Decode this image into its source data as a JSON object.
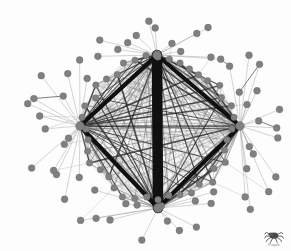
{
  "figure": {
    "name": "network-graph",
    "type": "force-directed network diagram",
    "background_color": "#fdfdfd",
    "node_color": "#808080",
    "node_stroke_color": "#6a6a6a",
    "thin_edge_color": "#9a9a9a",
    "thick_edge_color": "#101010"
  },
  "watermark": {
    "label": "Pajek",
    "icon": "spider-icon",
    "color": "#7a7a7a"
  },
  "chart_data": {
    "type": "network",
    "title": "",
    "node_count": 104,
    "hub_count": 4,
    "inner_ring_count": 40,
    "outer_pendant_count": 60,
    "node_radius_hub": 4.2,
    "node_radius_inner": 3.2,
    "node_radius_outer": 3.4,
    "hubs": [
      {
        "id": "H-top",
        "x": 157,
        "y": 55,
        "r": 4.4,
        "degree": 46
      },
      {
        "id": "H-left",
        "x": 80,
        "y": 126,
        "r": 4.4,
        "degree": 38
      },
      {
        "id": "H-right",
        "x": 240,
        "y": 126,
        "r": 4.4,
        "degree": 33
      },
      {
        "id": "H-bottom",
        "x": 158,
        "y": 208,
        "r": 4.6,
        "degree": 52
      }
    ],
    "hub_edges": [
      {
        "source": "H-top",
        "target": "H-bottom",
        "weight": 10.5
      },
      {
        "source": "H-top",
        "target": "H-left",
        "weight": 4.2
      },
      {
        "source": "H-top",
        "target": "H-right",
        "weight": 4.0
      },
      {
        "source": "H-left",
        "target": "H-bottom",
        "weight": 4.2
      },
      {
        "source": "H-right",
        "target": "H-bottom",
        "weight": 4.0
      },
      {
        "source": "H-left",
        "target": "H-right",
        "weight": 0.8
      }
    ],
    "inner_ring": {
      "center_x": 158,
      "center_y": 129,
      "radius_x": 74,
      "radius_y": 72,
      "count": 40,
      "edge_density": 0.42,
      "edge_color": "#9a9a9a",
      "edge_width": 0.35
    },
    "outer_corona": {
      "count": 60,
      "radius_min": 88,
      "radius_max": 132,
      "spoke_color": "#9a9a9a",
      "spoke_width": 0.55,
      "pendant_pairs": 5
    },
    "legend": [],
    "axes": false,
    "grid": false
  }
}
